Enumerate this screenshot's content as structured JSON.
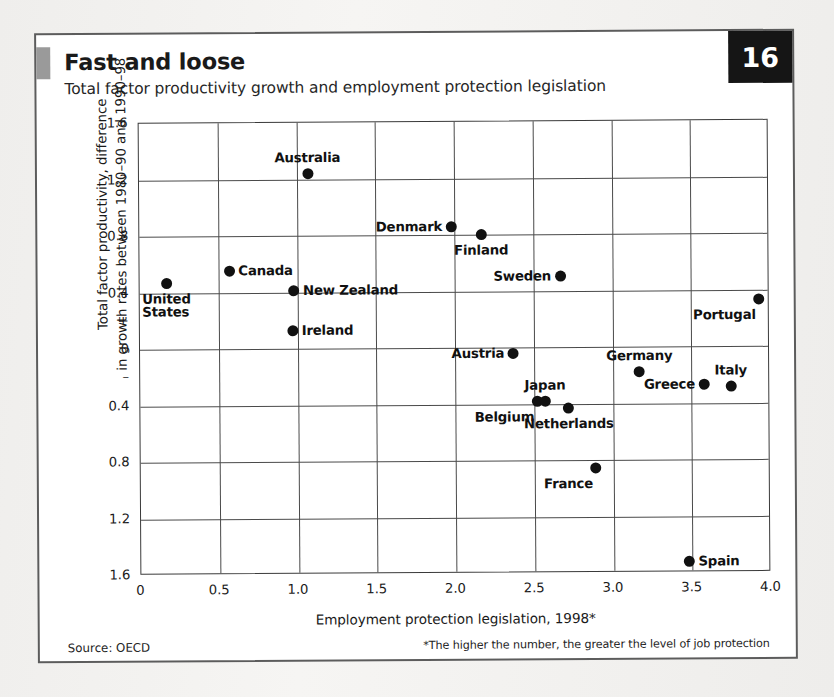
{
  "badge": {
    "number": "16"
  },
  "header": {
    "headline": "Fast and loose",
    "subhead": "Total factor productivity growth and employment protection legislation"
  },
  "footer": {
    "source": "Source: OECD",
    "footnote": "*The higher the number, the greater the level of job protection"
  },
  "chart_data": {
    "type": "scatter",
    "title": "Fast and loose",
    "subtitle": "Total factor productivity growth and employment protection legislation",
    "xlabel": "Employment protection legislation, 1998*",
    "ylabel": "Total factor productivity, difference\nin growth rates between 1980–90 and 1990–98",
    "ylabel_line1": "Total factor productivity, difference",
    "ylabel_line2": "in growth rates between 1980–90 and 1990–98",
    "xlim": [
      0,
      4.0
    ],
    "ylim": [
      -1.6,
      1.6
    ],
    "grid": true,
    "legend": "none",
    "xticks": [
      "0",
      "0.5",
      "1.0",
      "1.5",
      "2.0",
      "2.5",
      "3.0",
      "3.5",
      "4.0"
    ],
    "xtick_values": [
      0,
      0.5,
      1.0,
      1.5,
      2.0,
      2.5,
      3.0,
      3.5,
      4.0
    ],
    "yticks": [
      "1.6",
      "1.2",
      "0.8",
      "0.4",
      "+",
      "0",
      "–",
      "0.4",
      "0.8",
      "1.2",
      "1.6"
    ],
    "ytick_values": [
      1.6,
      1.2,
      0.8,
      0.4,
      0.2,
      0,
      -0.2,
      -0.4,
      -0.8,
      -1.2,
      -1.6
    ],
    "ytick_gridlines": [
      1.6,
      1.2,
      0.8,
      0.4,
      0,
      -0.4,
      -0.8,
      -1.2,
      -1.6
    ],
    "points": [
      {
        "label": "Australia",
        "x": 1.07,
        "y": 1.24,
        "pos": "above"
      },
      {
        "label": "Denmark",
        "x": 1.98,
        "y": 0.86,
        "pos": "left"
      },
      {
        "label": "Finland",
        "x": 2.17,
        "y": 0.8,
        "pos": "below"
      },
      {
        "label": "Canada",
        "x": 0.57,
        "y": 0.55,
        "pos": "right"
      },
      {
        "label": "Sweden",
        "x": 2.67,
        "y": 0.5,
        "pos": "left"
      },
      {
        "label": "United\nStates",
        "x": 0.17,
        "y": 0.47,
        "pos": "below"
      },
      {
        "label": "New Zealand",
        "x": 0.98,
        "y": 0.41,
        "pos": "right"
      },
      {
        "label": "Portugal",
        "x": 3.93,
        "y": 0.33,
        "pos": "belowleft"
      },
      {
        "label": "Ireland",
        "x": 0.97,
        "y": 0.13,
        "pos": "right"
      },
      {
        "label": "Austria",
        "x": 2.37,
        "y": -0.04,
        "pos": "left"
      },
      {
        "label": "Germany",
        "x": 3.17,
        "y": -0.18,
        "pos": "above"
      },
      {
        "label": "Greece",
        "x": 3.58,
        "y": -0.27,
        "pos": "left"
      },
      {
        "label": "Italy",
        "x": 3.75,
        "y": -0.28,
        "pos": "above"
      },
      {
        "label": "Belgium",
        "x": 2.52,
        "y": -0.38,
        "pos": "belowleft"
      },
      {
        "label": "Japan",
        "x": 2.57,
        "y": -0.38,
        "pos": "above"
      },
      {
        "label": "Netherlands",
        "x": 2.72,
        "y": -0.43,
        "pos": "below"
      },
      {
        "label": "France",
        "x": 2.89,
        "y": -0.86,
        "pos": "belowleft"
      },
      {
        "label": "Spain",
        "x": 3.48,
        "y": -1.52,
        "pos": "right"
      }
    ]
  }
}
